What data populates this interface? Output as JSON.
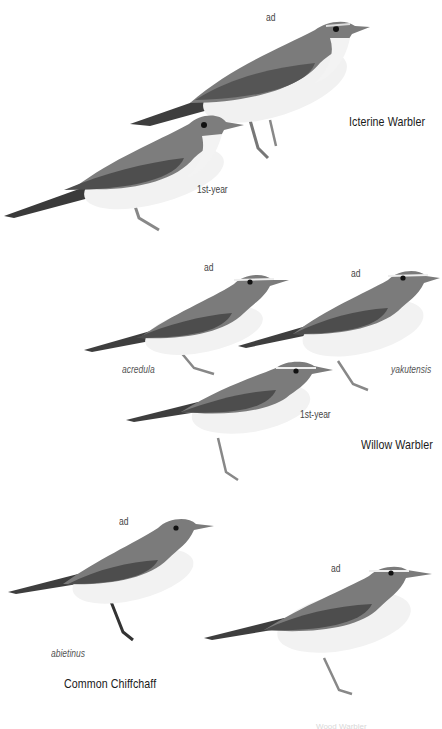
{
  "plate": {
    "groups": [
      {
        "species": "Icterine Warbler",
        "figures": [
          {
            "age": "ad",
            "subspecies": ""
          },
          {
            "age": "1st-year",
            "subspecies": ""
          }
        ]
      },
      {
        "species": "Willow Warbler",
        "figures": [
          {
            "age": "ad",
            "subspecies": "acredula"
          },
          {
            "age": "ad",
            "subspecies": "yakutensis"
          },
          {
            "age": "1st-year",
            "subspecies": ""
          }
        ]
      },
      {
        "species": "Common Chiffchaff",
        "figures": [
          {
            "age": "ad",
            "subspecies": "abietinus"
          }
        ]
      },
      {
        "species": "Wood Warbler",
        "figures": [
          {
            "age": "ad",
            "subspecies": ""
          }
        ]
      }
    ]
  },
  "colors": {
    "background": "#ffffff",
    "upperparts": "#7a7a7a",
    "wing_dark": "#4a4a4a",
    "underparts": "#f2f2f2",
    "label_text": "#333333"
  }
}
